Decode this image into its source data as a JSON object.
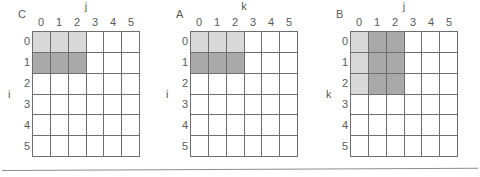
{
  "figure": {
    "caption_visible": false,
    "grid_size": 6,
    "axis_ticks": [
      "0",
      "1",
      "2",
      "3",
      "4",
      "5"
    ],
    "colors": {
      "light_fill": "#d9d9d9",
      "dark_fill": "#a9a9a9",
      "empty_fill": "#ffffff",
      "grid_line": "#6e6e6e",
      "text": "#5a5a5a",
      "rule": "#8d8d8d"
    },
    "matrices": [
      {
        "name": "C",
        "row_axis_label": "i",
        "col_axis_label": "j",
        "col_headers": [
          "0",
          "1",
          "2",
          "3",
          "4",
          "5"
        ],
        "row_headers": [
          "0",
          "1",
          "2",
          "3",
          "4",
          "5"
        ],
        "fills": [
          [
            "light",
            "light",
            "light",
            "none",
            "none",
            "none"
          ],
          [
            "dark",
            "dark",
            "dark",
            "none",
            "none",
            "none"
          ],
          [
            "none",
            "none",
            "none",
            "none",
            "none",
            "none"
          ],
          [
            "none",
            "none",
            "none",
            "none",
            "none",
            "none"
          ],
          [
            "none",
            "none",
            "none",
            "none",
            "none",
            "none"
          ],
          [
            "none",
            "none",
            "none",
            "none",
            "none",
            "none"
          ]
        ]
      },
      {
        "name": "A",
        "row_axis_label": "i",
        "col_axis_label": "k",
        "col_headers": [
          "0",
          "1",
          "2",
          "3",
          "4",
          "5"
        ],
        "row_headers": [
          "0",
          "1",
          "2",
          "3",
          "4",
          "5"
        ],
        "fills": [
          [
            "light",
            "light",
            "light",
            "none",
            "none",
            "none"
          ],
          [
            "dark",
            "dark",
            "dark",
            "none",
            "none",
            "none"
          ],
          [
            "none",
            "none",
            "none",
            "none",
            "none",
            "none"
          ],
          [
            "none",
            "none",
            "none",
            "none",
            "none",
            "none"
          ],
          [
            "none",
            "none",
            "none",
            "none",
            "none",
            "none"
          ],
          [
            "none",
            "none",
            "none",
            "none",
            "none",
            "none"
          ]
        ]
      },
      {
        "name": "B",
        "row_axis_label": "k",
        "col_axis_label": "j",
        "col_headers": [
          "0",
          "1",
          "2",
          "3",
          "4",
          "5"
        ],
        "row_headers": [
          "0",
          "1",
          "2",
          "3",
          "4",
          "5"
        ],
        "fills": [
          [
            "light",
            "dark",
            "dark",
            "none",
            "none",
            "none"
          ],
          [
            "light",
            "dark",
            "dark",
            "none",
            "none",
            "none"
          ],
          [
            "light",
            "dark",
            "dark",
            "none",
            "none",
            "none"
          ],
          [
            "none",
            "none",
            "none",
            "none",
            "none",
            "none"
          ],
          [
            "none",
            "none",
            "none",
            "none",
            "none",
            "none"
          ],
          [
            "none",
            "none",
            "none",
            "none",
            "none",
            "none"
          ]
        ]
      }
    ]
  }
}
